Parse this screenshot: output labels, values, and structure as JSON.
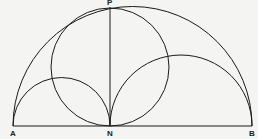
{
  "diagram": {
    "type": "geometric-construction",
    "labels": {
      "A": "A",
      "N": "N",
      "B": "B",
      "P": "P"
    },
    "points": {
      "A": [
        13,
        126
      ],
      "N": [
        110,
        126
      ],
      "B": [
        252,
        126
      ],
      "P": [
        110,
        7
      ]
    },
    "shapes": [
      {
        "name": "semicircle-AB",
        "center": [
          132.5,
          126
        ],
        "r": 119.5
      },
      {
        "name": "semicircle-AN",
        "center": [
          61.5,
          126
        ],
        "r": 48.5
      },
      {
        "name": "semicircle-NB",
        "center": [
          181,
          126
        ],
        "r": 71
      },
      {
        "name": "circle-NP",
        "center": [
          110,
          67
        ],
        "r": 59
      },
      {
        "name": "segment-NP"
      },
      {
        "name": "segment-AB"
      }
    ],
    "colors": {
      "stroke": "#1a1a1a",
      "background": "#f4f4f2"
    }
  }
}
